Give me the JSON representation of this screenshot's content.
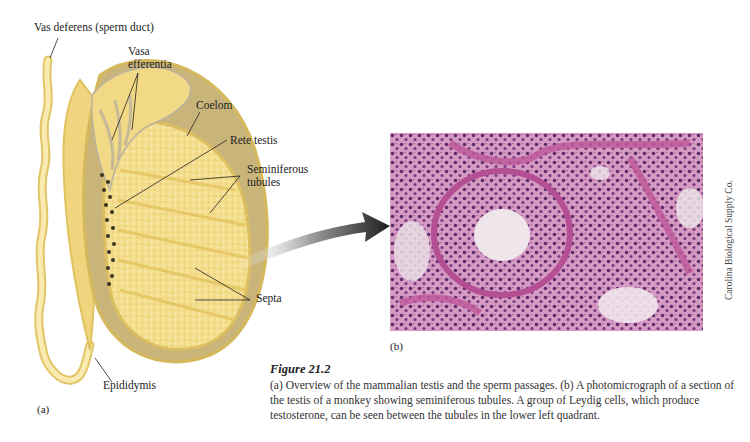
{
  "figure": {
    "number_label": "Figure 21.2",
    "caption": "(a) Overview of the mammalian testis and the sperm passages. (b) A photomicrograph of a section of the testis of a monkey showing seminiferous tubules. A group of Leydig cells, which produce testosterone, can be seen between the tubules in the lower left quadrant."
  },
  "panel_a": {
    "letter": "(a)",
    "labels": {
      "vas_deferens": "Vas deferens (sperm duct)",
      "vasa_efferentia_1": "Vasa",
      "vasa_efferentia_2": "efferentia",
      "coelom": "Coelom",
      "rete_testis": "Rete testis",
      "seminiferous_1": "Seminiferous",
      "seminiferous_2": "tubules",
      "septa": "Septa",
      "epididymis": "Epididymis"
    },
    "colors": {
      "tubule_fill": "#f3dc8a",
      "tubule_light": "#f8ecb0",
      "coelom": "#c7b37a",
      "capsule": "#d9b95a",
      "gray_channel": "#b9b3a0",
      "rete_dots": "#3a3420"
    }
  },
  "panel_b": {
    "letter": "(b)",
    "credit": "Carolina Biological Supply Co.",
    "colors": {
      "stain_pink": "#c96aa8",
      "stain_purple": "#6a2f73",
      "lumen": "#efe6ec"
    }
  },
  "arrow": {
    "icon": "curved-arrow-icon",
    "color": "#2b2b2b"
  }
}
